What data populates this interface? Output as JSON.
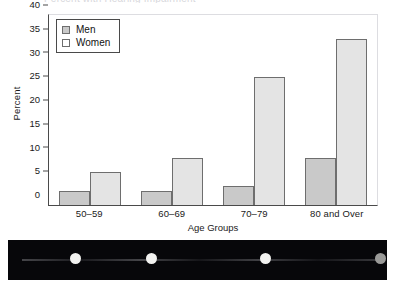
{
  "clipped_title": "Percent with Hearing Impairment",
  "chart_data": {
    "type": "bar",
    "title": "",
    "xlabel": "Age Groups",
    "ylabel": "Percent",
    "categories": [
      "50–59",
      "60–69",
      "70–79",
      "80 and Over"
    ],
    "series": [
      {
        "name": "Men",
        "values": [
          3,
          3,
          4,
          10
        ]
      },
      {
        "name": "Women",
        "values": [
          7,
          10,
          27,
          35
        ]
      }
    ],
    "ylim": [
      0,
      40
    ],
    "yticks": [
      0,
      5,
      10,
      15,
      20,
      25,
      30,
      35,
      40
    ],
    "grid": false,
    "legend_position": "top-left",
    "colors": {
      "men": "#c9c9c9",
      "women": "#e4e4e4",
      "bar_edge": "#6e6e6e",
      "axis": "#4a4a4a"
    }
  },
  "legend": {
    "entries": [
      {
        "label": "Men",
        "swatch": "men-swatch"
      },
      {
        "label": "Women",
        "swatch": "women-swatch"
      }
    ]
  },
  "filmstrip": {
    "dots": [
      {
        "name": "filmstrip-dot-1",
        "left": 62,
        "state": "bright"
      },
      {
        "name": "filmstrip-dot-2",
        "left": 138,
        "state": "bright"
      },
      {
        "name": "filmstrip-dot-3",
        "left": 252,
        "state": "bright"
      },
      {
        "name": "filmstrip-dot-4",
        "left": 367,
        "state": "dim"
      }
    ]
  }
}
